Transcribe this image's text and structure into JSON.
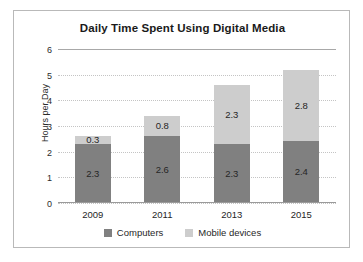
{
  "chart_data": {
    "type": "bar",
    "subtype": "stacked-bar",
    "title": "Daily Time Spent Using Digital Media",
    "xlabel": "",
    "ylabel": "Hours per Day",
    "categories": [
      "2009",
      "2011",
      "2013",
      "2015"
    ],
    "yticks": [
      "0",
      "1",
      "2",
      "3",
      "4",
      "5",
      "6"
    ],
    "ylim": [
      0,
      6
    ],
    "grid": true,
    "grid_style": "dotted-horizontal",
    "legend_position": "bottom",
    "series": [
      {
        "name": "Computers",
        "color": "#808080",
        "values": [
          2.3,
          2.6,
          2.3,
          2.4
        ],
        "labels": [
          "2.3",
          "2.6",
          "2.3",
          "2.4"
        ]
      },
      {
        "name": "Mobile devices",
        "color": "#cdcdcd",
        "values": [
          0.3,
          0.8,
          2.3,
          2.8
        ],
        "labels": [
          "0.3",
          "0.8",
          "2.3",
          "2.8"
        ]
      }
    ],
    "totals": [
      2.6,
      3.4,
      4.6,
      5.2
    ]
  }
}
